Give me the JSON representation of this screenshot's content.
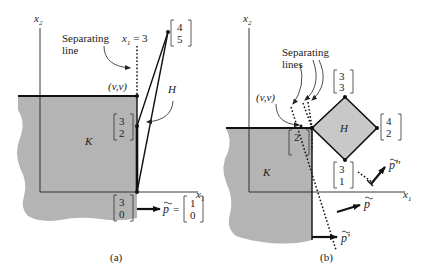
{
  "panels": [
    {
      "id": "a",
      "caption": "(a)",
      "axis_x": "x",
      "axis_x_sub": "1",
      "axis_y": "x",
      "axis_y_sub": "2",
      "set_K": "K",
      "set_H": "H",
      "separating_line_label": [
        "Separating",
        "line"
      ],
      "line_eq": "x",
      "line_eq_sub": "1",
      "line_eq_rhs": "= 3",
      "point_vv": "(v,v)",
      "vec_45": [
        "4",
        "5"
      ],
      "vec_32": [
        "3",
        "2"
      ],
      "vec_30": [
        "3",
        "0"
      ],
      "p_label": "p",
      "p_eq": "=",
      "p_vec": [
        "1",
        "0"
      ]
    },
    {
      "id": "b",
      "caption": "(b)",
      "axis_x": "x",
      "axis_x_sub": "1",
      "axis_y": "x",
      "axis_y_sub": "2",
      "set_K": "K",
      "set_H": "H",
      "separating_line_label": [
        "Separating",
        "lines"
      ],
      "point_vv": "(v,v)",
      "vec_33": [
        "3",
        "3"
      ],
      "vec_42": [
        "4",
        "2"
      ],
      "vec_2": [
        "2"
      ],
      "vec_31": [
        "3",
        "1"
      ],
      "p_label": "p",
      "p_prime_label": "p'",
      "p_dprime_label": "p''"
    }
  ]
}
